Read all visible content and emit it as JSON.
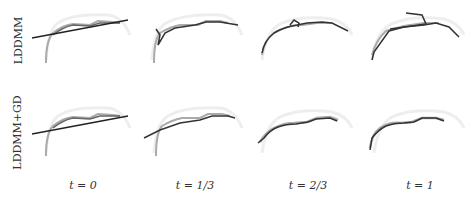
{
  "rows": [
    {
      "label": "LDDMM"
    },
    {
      "label": "LDDMM+GD"
    }
  ],
  "columns": [
    {
      "label": "t = 0"
    },
    {
      "label": "t = 1/3"
    },
    {
      "label": "t = 2/3"
    },
    {
      "label": "t = 1"
    }
  ],
  "colors": {
    "target_curve": "#b0b0b0",
    "deformed_curve": "#333333",
    "faint_arc": "#e6e6e6"
  }
}
